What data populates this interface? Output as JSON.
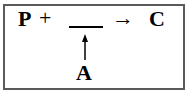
{
  "diagram": {
    "type": "reaction-scheme",
    "reactant": "P",
    "plus": "+",
    "blank": "",
    "yields_arrow": "→",
    "product": "C",
    "added_component": "A",
    "added_arrow_direction": "up",
    "colors": {
      "text": "#000000",
      "border": "#5a5a5a",
      "background": "#ffffff"
    }
  }
}
